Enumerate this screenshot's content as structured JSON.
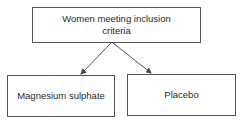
{
  "diagram": {
    "type": "flowchart",
    "nodes": [
      {
        "id": "root",
        "label": "Women meeting inclusion criteria"
      },
      {
        "id": "mgso4",
        "label": "Magnesium sulphate"
      },
      {
        "id": "placebo",
        "label": "Placebo"
      }
    ],
    "edges": [
      {
        "from": "root",
        "to": "mgso4"
      },
      {
        "from": "root",
        "to": "placebo"
      }
    ],
    "colors": {
      "line": "#555555",
      "text": "#2a2a2a"
    }
  }
}
